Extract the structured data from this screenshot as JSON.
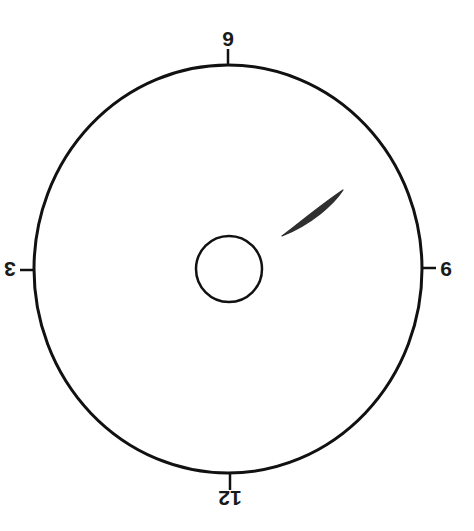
{
  "diagram": {
    "colors": {
      "background": "#ffffff",
      "stroke": "#111111",
      "mark_fill": "#2f2f2f"
    },
    "clock_labels": {
      "top": "9",
      "bottom": "12",
      "left": "3",
      "right": "6"
    },
    "mark": {
      "shape": "elongated spindle",
      "clock_position": "approximately 4 o'clock (relative to the rotated dial)"
    }
  }
}
